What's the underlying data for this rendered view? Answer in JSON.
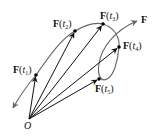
{
  "diagram": {
    "type": "vector-valued function curve",
    "origin_label": "O",
    "curve_label": "F",
    "points": [
      {
        "name": "t1",
        "label_fn": "F",
        "label_arg": "t",
        "label_sub": "1",
        "x": 36,
        "y": 75
      },
      {
        "name": "t2",
        "label_fn": "F",
        "label_arg": "t",
        "label_sub": "2",
        "x": 75,
        "y": 31
      },
      {
        "name": "t3",
        "label_fn": "F",
        "label_arg": "t",
        "label_sub": "3",
        "x": 103,
        "y": 24
      },
      {
        "name": "t4",
        "label_fn": "F",
        "label_arg": "t",
        "label_sub": "4",
        "x": 119,
        "y": 47
      },
      {
        "name": "t5",
        "label_fn": "F",
        "label_arg": "t",
        "label_sub": "5",
        "x": 99,
        "y": 79
      }
    ],
    "origin": {
      "x": 29,
      "y": 119
    },
    "colors": {
      "curve": "#666666",
      "vectors": "#111111",
      "points": "#000000"
    }
  }
}
